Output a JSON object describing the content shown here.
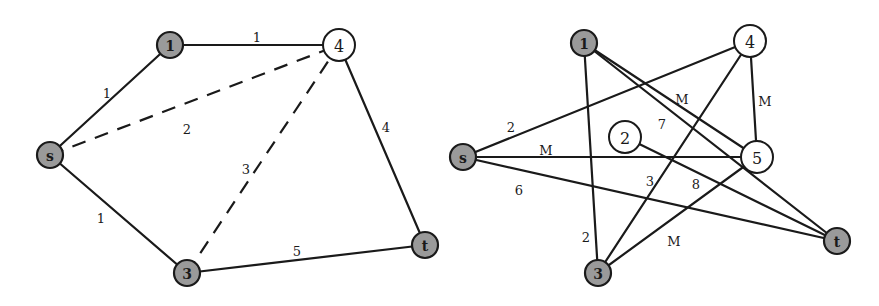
{
  "left_graph": {
    "nodes": [
      {
        "id": "s",
        "label": "s",
        "x": 50,
        "y": 155,
        "style": "shaded"
      },
      {
        "id": "1",
        "label": "1",
        "x": 170,
        "y": 45,
        "style": "shaded"
      },
      {
        "id": "4",
        "label": "4",
        "x": 339,
        "y": 45,
        "style": "open"
      },
      {
        "id": "3",
        "label": "3",
        "x": 187,
        "y": 273,
        "style": "shaded"
      },
      {
        "id": "t",
        "label": "t",
        "x": 425,
        "y": 245,
        "style": "shaded"
      }
    ],
    "edges": [
      {
        "from": "s",
        "to": "1",
        "weight": "1",
        "style": "solid",
        "lx": 107,
        "ly": 93
      },
      {
        "from": "1",
        "to": "4",
        "weight": "1",
        "style": "solid",
        "lx": 257,
        "ly": 37
      },
      {
        "from": "s",
        "to": "4",
        "weight": "2",
        "style": "dashed",
        "lx": 187,
        "ly": 129
      },
      {
        "from": "3",
        "to": "4",
        "weight": "3",
        "style": "dashed",
        "lx": 246,
        "ly": 169
      },
      {
        "from": "s",
        "to": "3",
        "weight": "1",
        "style": "solid",
        "lx": 101,
        "ly": 218
      },
      {
        "from": "4",
        "to": "t",
        "weight": "4",
        "style": "solid",
        "lx": 386,
        "ly": 127
      },
      {
        "from": "3",
        "to": "t",
        "weight": "5",
        "style": "solid",
        "lx": 297,
        "ly": 251
      }
    ]
  },
  "right_graph": {
    "nodes": [
      {
        "id": "s",
        "label": "s",
        "x": 463,
        "y": 157,
        "style": "shaded"
      },
      {
        "id": "1",
        "label": "1",
        "x": 584,
        "y": 43,
        "style": "shaded"
      },
      {
        "id": "4",
        "label": "4",
        "x": 750,
        "y": 41,
        "style": "open"
      },
      {
        "id": "2",
        "label": "2",
        "x": 625,
        "y": 137,
        "style": "open"
      },
      {
        "id": "5",
        "label": "5",
        "x": 757,
        "y": 157,
        "style": "open"
      },
      {
        "id": "3",
        "label": "3",
        "x": 598,
        "y": 273,
        "style": "shaded"
      },
      {
        "id": "t",
        "label": "t",
        "x": 837,
        "y": 241,
        "style": "shaded"
      }
    ],
    "edges": [
      {
        "from": "s",
        "to": "4",
        "weight": "2",
        "lx": 511,
        "ly": 127
      },
      {
        "from": "s",
        "to": "5",
        "weight": "M",
        "lx": 546,
        "ly": 150
      },
      {
        "from": "s",
        "to": "t",
        "weight": "6",
        "lx": 519,
        "ly": 190
      },
      {
        "from": "1",
        "to": "5",
        "weight": "M",
        "lx": 682,
        "ly": 99
      },
      {
        "from": "1",
        "to": "t",
        "weight": "7",
        "lx": 662,
        "ly": 124
      },
      {
        "from": "1",
        "to": "3",
        "weight": "2",
        "lx": 586,
        "ly": 237
      },
      {
        "from": "4",
        "to": "5",
        "weight": "M",
        "lx": 765,
        "ly": 101
      },
      {
        "from": "4",
        "to": "3",
        "weight": "3",
        "lx": 650,
        "ly": 181
      },
      {
        "from": "2",
        "to": "t",
        "weight": "8",
        "lx": 696,
        "ly": 184
      },
      {
        "from": "5",
        "to": "3",
        "weight": "M",
        "lx": 674,
        "ly": 241
      }
    ]
  }
}
